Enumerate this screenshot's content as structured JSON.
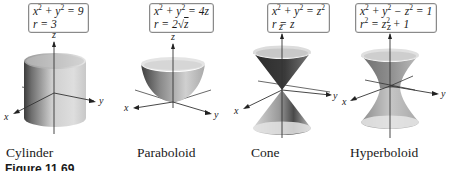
{
  "figure": {
    "label": "Figure 11.69",
    "panels": [
      {
        "name": "Cylinder",
        "caption": "Cylinder",
        "equation_rect": {
          "lhs": "x",
          "lhs_exp": "2",
          "mid": " + y",
          "mid_exp": "2",
          "rhs": " = 9"
        },
        "equation_polar": "r = 3",
        "axes": {
          "x": "x",
          "y": "y",
          "z": "z"
        }
      },
      {
        "name": "Paraboloid",
        "caption": "Paraboloid",
        "equation_rect": {
          "lhs": "x",
          "lhs_exp": "2",
          "mid": " + y",
          "mid_exp": "2",
          "rhs": " = 4z"
        },
        "equation_polar": {
          "prefix": "r = 2",
          "radical": "√",
          "radicand": "z"
        },
        "axes": {
          "x": "x",
          "y": "y",
          "z": "z"
        }
      },
      {
        "name": "Cone",
        "caption": "Cone",
        "equation_rect": {
          "lhs": "x",
          "lhs_exp": "2",
          "mid": " + y",
          "mid_exp": "2",
          "rhs": " = z",
          "rhs_exp": "2"
        },
        "equation_polar": "r = z",
        "axes": {
          "x": "x",
          "y": "y",
          "z": "z"
        }
      },
      {
        "name": "Hyperboloid",
        "caption": "Hyperboloid",
        "equation_rect": {
          "lhs": "x",
          "lhs_exp": "2",
          "mid": " + y",
          "mid_exp": "2",
          "mid2": " − z",
          "mid2_exp": "2",
          "rhs": " = 1"
        },
        "equation_polar": {
          "lhs": "r",
          "lhs_exp": "2",
          "mid": " = z",
          "mid_exp": "2",
          "rhs": " + 1"
        },
        "axes": {
          "x": "x",
          "y": "y",
          "z": "z"
        }
      }
    ]
  },
  "colors": {
    "surface_dark": "#4a4a4a",
    "surface_mid": "#9a9a9a",
    "surface_light": "#e2e2e2",
    "box_border": "#8a8a8a"
  }
}
